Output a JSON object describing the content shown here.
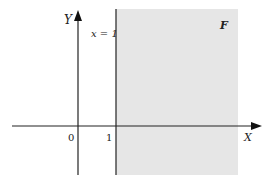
{
  "diagram": {
    "region_label": "F",
    "line_label": "x = 1",
    "x_axis_label": "X",
    "y_axis_label": "Y",
    "origin_label": "0",
    "tick_label": "1",
    "colors": {
      "region_fill": "#e6e6e6",
      "axis": "#222222",
      "boundary_line": "#333333"
    }
  }
}
